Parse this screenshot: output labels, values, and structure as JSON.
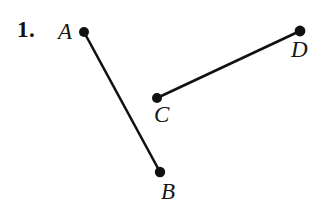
{
  "figure": {
    "problem_number": "1.",
    "background_color": "#ffffff",
    "ink_color": "#111111",
    "width": 332,
    "height": 207,
    "points": [
      {
        "name": "A",
        "label": "A",
        "x": 84,
        "y": 32,
        "dot_radius": 5.0,
        "label_x": 58,
        "label_y": 20
      },
      {
        "name": "B",
        "label": "B",
        "x": 160,
        "y": 172,
        "dot_radius": 5.2,
        "label_x": 161,
        "label_y": 180
      },
      {
        "name": "C",
        "label": "C",
        "x": 157,
        "y": 98,
        "dot_radius": 5.0,
        "label_x": 154,
        "label_y": 103
      },
      {
        "name": "D",
        "label": "D",
        "x": 300,
        "y": 31,
        "dot_radius": 5.4,
        "label_x": 291,
        "label_y": 38
      }
    ],
    "segments": [
      {
        "name": "segment-AB",
        "from": "A",
        "to": "B",
        "x1": 84,
        "y1": 32,
        "x2": 160,
        "y2": 172,
        "stroke_width": 2.6
      },
      {
        "name": "segment-CD",
        "from": "C",
        "to": "D",
        "x1": 157,
        "y1": 98,
        "x2": 300,
        "y2": 31,
        "stroke_width": 2.6
      }
    ],
    "number_x": 17,
    "number_y": 18
  }
}
